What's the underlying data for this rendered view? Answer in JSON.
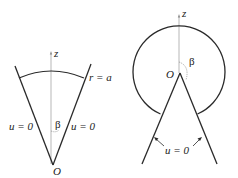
{
  "left_figure": {
    "axis_label": "z",
    "boundary_label": "r = a",
    "left_edge_label": "u = 0",
    "right_edge_label": "u = 0",
    "angle_label": "β",
    "origin_label": "O"
  },
  "right_figure": {
    "axis_label": "z",
    "angle_label": "β",
    "origin_label": "O",
    "edge_label": "u = 0"
  },
  "colors": {
    "line": "#2a2a2a",
    "axis": "#888888",
    "background": "#ffffff"
  }
}
